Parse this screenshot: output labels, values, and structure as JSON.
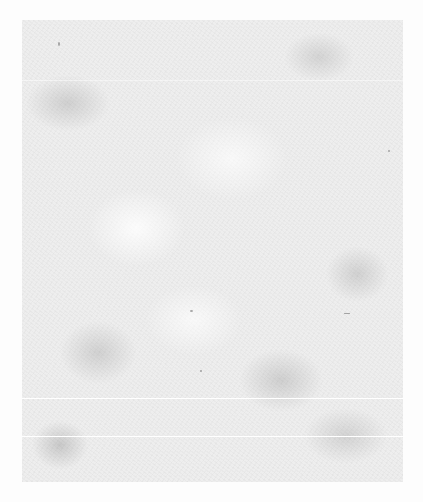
{
  "document": {
    "type": "blank-paper-scan",
    "text_content": [],
    "colors": {
      "background": "#fdfdfd",
      "paper": "#ececec",
      "mottle": "#969696",
      "fold_line": "#ffffff"
    },
    "fold_lines": [
      {
        "y": 60,
        "style": "faint"
      },
      {
        "y": 378,
        "style": "solid"
      },
      {
        "y": 416,
        "style": "solid"
      }
    ]
  }
}
